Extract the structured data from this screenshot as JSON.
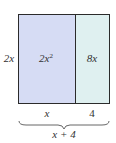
{
  "diagram": {
    "type": "area-model",
    "side_label": "2x",
    "regions": [
      {
        "label": "2x",
        "exponent": "2",
        "color": "#d6dcf4"
      },
      {
        "label": "8x",
        "color": "#dff0f0"
      }
    ],
    "bottom_labels": [
      "x",
      "4"
    ],
    "total_label": "x + 4",
    "border_color": "#2b2b2b"
  }
}
